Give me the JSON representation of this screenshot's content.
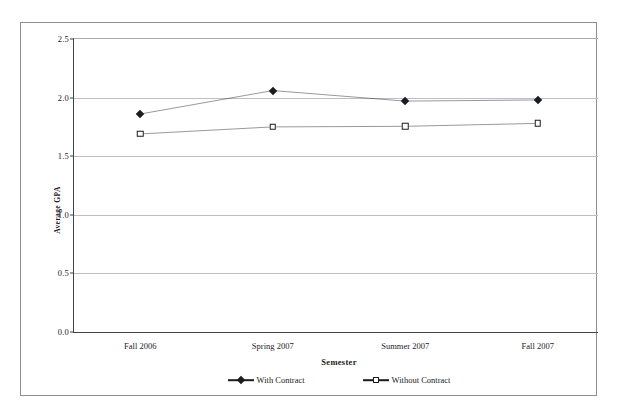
{
  "chart_data": {
    "type": "line",
    "title": "",
    "xlabel": "Semester",
    "ylabel": "Average GPA",
    "categories": [
      "Fall 2006",
      "Spring 2007",
      "Summer 2007",
      "Fall 2007"
    ],
    "series": [
      {
        "name": "With Contract",
        "marker": "filled-diamond",
        "color": "#1b1b22",
        "values": [
          1.86,
          2.06,
          1.97,
          1.98
        ]
      },
      {
        "name": "Without Contract",
        "marker": "open-square",
        "color": "#1b1b22",
        "values": [
          1.69,
          1.75,
          1.755,
          1.78
        ]
      }
    ],
    "ylim": [
      0.0,
      2.5
    ],
    "ytick_labels": [
      "0.0",
      "0.5",
      "1.0",
      "1.5",
      "2.0",
      "2.5"
    ],
    "ytick_values": [
      0.0,
      0.5,
      1.0,
      1.5,
      2.0,
      2.5
    ],
    "grid": true,
    "grid_color": "#b9bfcc",
    "legend_position": "bottom",
    "axis_color": "#43434a",
    "frame_color": "#8d8d93"
  },
  "legend": {
    "entries": [
      {
        "label": "With Contract"
      },
      {
        "label": "Without Contract"
      }
    ]
  },
  "axes": {
    "x_title": "Semester",
    "y_title": "Average GPA"
  }
}
